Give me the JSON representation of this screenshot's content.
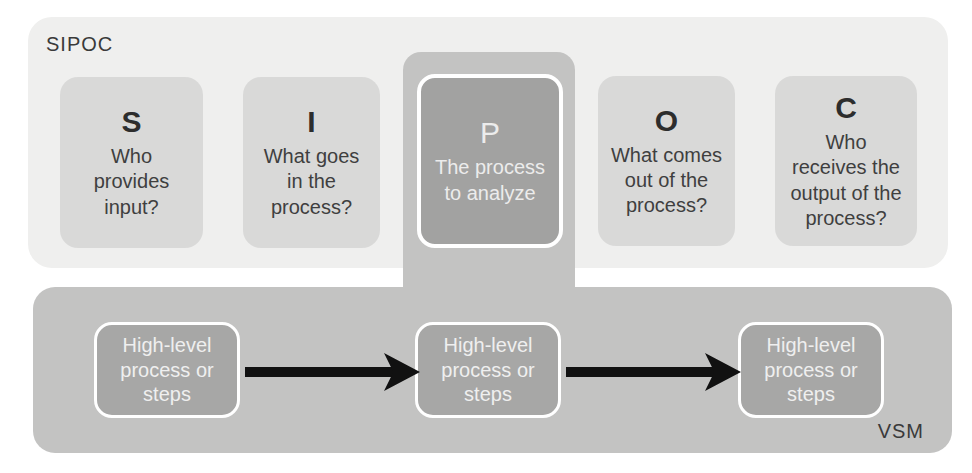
{
  "colors": {
    "page_bg": "#ffffff",
    "sipoc_bg": "#efefee",
    "light_box_bg": "#d9d9d8",
    "mid_bg": "#c3c3c2",
    "dark_box_bg": "#a2a2a1",
    "vsm_box_bg": "#a7a7a6",
    "dark_text": "#3a3a3a",
    "light_text": "#ececec",
    "arrow": "#111111"
  },
  "sipoc": {
    "label": "SIPOC",
    "boxes": [
      {
        "letter": "S",
        "lines": [
          "Who",
          "provides",
          "input?"
        ]
      },
      {
        "letter": "I",
        "lines": [
          "What goes",
          "in the",
          "process?"
        ]
      },
      {
        "letter": "P",
        "lines": [
          "The process",
          "to analyze"
        ]
      },
      {
        "letter": "O",
        "lines": [
          "What comes",
          "out of the",
          "process?"
        ]
      },
      {
        "letter": "C",
        "lines": [
          "Who",
          "receives the",
          "output of the",
          "process?"
        ]
      }
    ]
  },
  "vsm": {
    "label": "VSM",
    "steps": [
      {
        "lines": [
          "High-level",
          "process or",
          "steps"
        ]
      },
      {
        "lines": [
          "High-level",
          "process or",
          "steps"
        ]
      },
      {
        "lines": [
          "High-level",
          "process or",
          "steps"
        ]
      }
    ]
  }
}
